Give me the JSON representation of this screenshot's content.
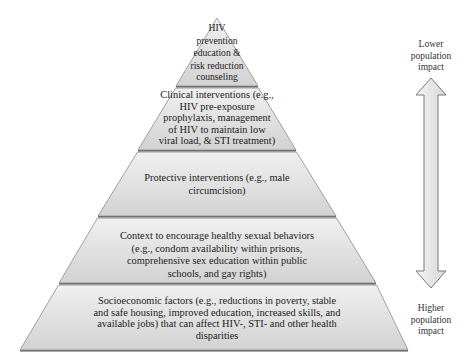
{
  "diagram": {
    "type": "pyramid",
    "levels": [
      {
        "id": "top",
        "text": "HIV prevention education & risk reduction counseling",
        "lines": [
          "HIV",
          "prevention",
          "education &",
          "risk reduction",
          "counseling"
        ]
      },
      {
        "id": "clinical",
        "text": "Clinical interventions (e.g., HIV pre-exposure prophylaxis, management of HIV to maintain low viral load, & STI treatment)",
        "lines": [
          "Clinical interventions (e.g.,",
          "HIV pre-exposure",
          "prophylaxis, management",
          "of HIV to maintain low",
          "viral load, & STI treatment)"
        ]
      },
      {
        "id": "protective",
        "text": "Protective interventions (e.g., male circumcision)",
        "lines": [
          "Protective interventions (e.g., male",
          "circumcision)"
        ]
      },
      {
        "id": "context",
        "text": "Context to encourage healthy sexual behaviors (e.g., condom availability within prisons, comprehensive sex education within public schools, and gay rights)",
        "lines": [
          "Context to encourage healthy sexual behaviors",
          "(e.g., condom availability within prisons,",
          "comprehensive sex education within public",
          "schools, and gay rights)"
        ]
      },
      {
        "id": "socioeconomic",
        "text": "Socioeconomic factors (e.g., reductions in poverty, stable and safe housing, improved education, increased skills, and available jobs) that can affect HIV-, STI- and other health disparities",
        "lines": [
          "Socioeconomic factors (e.g., reductions in poverty, stable",
          "and safe housing, improved education, increased skills, and",
          "available jobs) that can affect HIV-, STI- and other health",
          "disparities"
        ]
      }
    ],
    "arrow": {
      "icon": "double-headed-vertical-arrow-icon",
      "top_label": "Lower population impact",
      "top_lines": [
        "Lower",
        "population",
        "impact"
      ],
      "bottom_label": "Higher population impact",
      "bottom_lines": [
        "Higher",
        "population",
        "impact"
      ]
    },
    "colors": {
      "fill": "#d9d9d9",
      "fill_light": "#ececec",
      "stroke": "#8c8c8c",
      "shadow": "#555555",
      "arrow_fill": "#e6e6e6",
      "arrow_stroke": "#7a7a7a"
    }
  }
}
